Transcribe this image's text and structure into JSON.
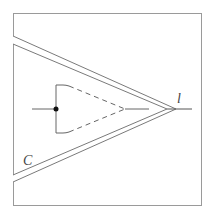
{
  "diagram": {
    "labels": {
      "apex_label": "l",
      "boundary_label": "C"
    },
    "colors": {
      "stroke": "#8a8a8a",
      "dark_stroke": "#555555",
      "dot": "#111111",
      "background": "#ffffff"
    }
  }
}
